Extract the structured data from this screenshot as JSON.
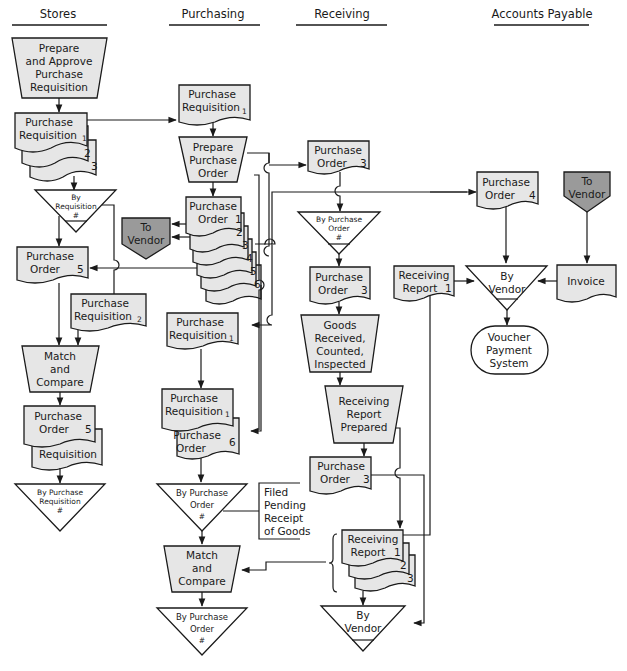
{
  "columns": {
    "stores": "Stores",
    "purchasing": "Purchasing",
    "receiving": "Receiving",
    "accounts_payable": "Accounts Payable"
  },
  "stores": {
    "prepare": [
      "Prepare",
      "and Approve",
      "Purchase",
      "Requisition"
    ],
    "pr_doc": {
      "l1": "Purchase",
      "l2": "Requisition",
      "n1": "1",
      "n2": "2",
      "n3": "3"
    },
    "file_by_req": [
      "By",
      "Requisition",
      "#"
    ],
    "po5": {
      "l1": "Purchase",
      "l2": "Order",
      "n": "5"
    },
    "pr2": {
      "l1": "Purchase",
      "l2": "Requisition",
      "n": "2"
    },
    "match": [
      "Match",
      "and",
      "Compare"
    ],
    "po5_req": {
      "l1": "Purchase",
      "l2": "Order",
      "n": "5",
      "l3": "Requisition"
    },
    "file_by_pr": [
      "By Purchase",
      "Requisition",
      "#"
    ]
  },
  "purchasing": {
    "pr1_top": {
      "l1": "Purchase",
      "l2": "Requisition",
      "n": "1"
    },
    "prepare_po": [
      "Prepare",
      "Purchase",
      "Order"
    ],
    "po_stack": {
      "l1": "Purchase",
      "l2": "Order",
      "nums": [
        "1",
        "2",
        "3",
        "4",
        "5",
        "6"
      ]
    },
    "to_vendor": [
      "To",
      "Vendor"
    ],
    "pr1_mid": {
      "l1": "Purchase",
      "l2": "Requisition",
      "n": "1"
    },
    "pr1_po6": {
      "l1": "Purchase",
      "l2": "Requisition",
      "n1": "1",
      "l3": "Purchase",
      "l4": "Order",
      "n2": "6"
    },
    "file_by_po": [
      "By Purchase",
      "Order",
      "#"
    ],
    "annotation": [
      "Filed",
      "Pending",
      "Receipt",
      "of Goods"
    ],
    "match": [
      "Match",
      "and",
      "Compare"
    ],
    "file_by_po_final": [
      "By Purchase",
      "Order",
      "#"
    ]
  },
  "receiving": {
    "po3_top": {
      "l1": "Purchase",
      "l2": "Order",
      "n": "3"
    },
    "file_by_po": [
      "By Purchase",
      "Order",
      "#"
    ],
    "po3_mid": {
      "l1": "Purchase",
      "l2": "Order",
      "n": "3"
    },
    "goods": [
      "Goods",
      "Received,",
      "Counted,",
      "Inspected"
    ],
    "rr_prepared": [
      "Receiving",
      "Report",
      "Prepared"
    ],
    "po3_low": {
      "l1": "Purchase",
      "l2": "Order",
      "n": "3"
    },
    "rr_stack": {
      "l1": "Receiving",
      "l2": "Report",
      "nums": [
        "1",
        "2",
        "3"
      ]
    },
    "file_by_vendor": [
      "By",
      "Vendor"
    ]
  },
  "accounts_payable": {
    "po4": {
      "l1": "Purchase",
      "l2": "Order",
      "n": "4"
    },
    "to_vendor": [
      "To",
      "Vendor"
    ],
    "rr1": {
      "l1": "Receiving",
      "l2": "Report",
      "n": "1"
    },
    "file_by_vendor": [
      "By",
      "Vendor"
    ],
    "invoice": "Invoice",
    "voucher": [
      "Voucher",
      "Payment",
      "System"
    ]
  },
  "colors": {
    "document_fill": "#e6e6e6",
    "offpage_fill": "#9a9a9a",
    "line": "#1a1a1a"
  }
}
